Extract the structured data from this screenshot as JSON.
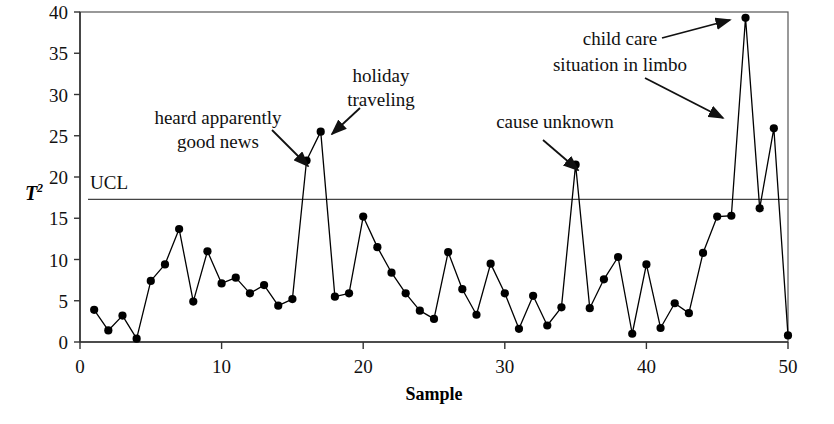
{
  "chart_data": {
    "type": "line",
    "title": "",
    "xlabel": "Sample",
    "ylabel": "T²",
    "ylabel_base": "T",
    "ylabel_exponent": "2",
    "xlim": [
      0,
      50
    ],
    "ylim": [
      0,
      40
    ],
    "grid": false,
    "legend": "none",
    "x_ticks": [
      0,
      10,
      20,
      30,
      40,
      50
    ],
    "y_ticks": [
      0,
      5,
      10,
      15,
      20,
      25,
      30,
      35,
      40
    ],
    "marker": "filled-circle",
    "line_color": "#000000",
    "marker_color": "#000000",
    "control_limits": [
      {
        "name": "UCL",
        "label": "UCL",
        "value": 17.3
      }
    ],
    "x": [
      1,
      2,
      3,
      4,
      5,
      6,
      7,
      8,
      9,
      10,
      11,
      12,
      13,
      14,
      15,
      16,
      17,
      18,
      19,
      20,
      21,
      22,
      23,
      24,
      25,
      26,
      27,
      28,
      29,
      30,
      31,
      32,
      33,
      34,
      35,
      36,
      37,
      38,
      39,
      40,
      41,
      42,
      43,
      44,
      45,
      46,
      47,
      48,
      49,
      50
    ],
    "values": [
      3.9,
      1.4,
      3.2,
      0.4,
      7.4,
      9.4,
      13.7,
      4.9,
      11.0,
      7.1,
      7.8,
      5.9,
      6.9,
      4.4,
      5.2,
      22.0,
      25.5,
      5.5,
      5.9,
      15.2,
      11.5,
      8.4,
      5.9,
      3.8,
      2.8,
      10.9,
      6.4,
      3.3,
      9.5,
      5.9,
      1.6,
      5.6,
      2.0,
      4.2,
      21.5,
      4.1,
      7.6,
      10.3,
      1.0,
      9.4,
      1.7,
      4.7,
      3.5,
      10.8,
      15.2,
      15.3,
      39.3,
      16.2,
      25.9,
      0.8
    ],
    "annotations": [
      {
        "id": "heard-good-news",
        "lines": [
          "heard apparently",
          "good news"
        ],
        "text_x": 218,
        "text_y": 124,
        "line_height": 24,
        "align": "middle",
        "arrow": {
          "x1": 272,
          "y1": 130,
          "x2": 308,
          "y2": 166
        },
        "points_to_sample": 16
      },
      {
        "id": "holiday-traveling",
        "lines": [
          "holiday",
          "traveling"
        ],
        "text_x": 381,
        "text_y": 82,
        "line_height": 24,
        "align": "middle",
        "arrow": {
          "x1": 360,
          "y1": 108,
          "x2": 332,
          "y2": 134
        },
        "points_to_sample": 17
      },
      {
        "id": "cause-unknown",
        "lines": [
          "cause unknown"
        ],
        "text_x": 555,
        "text_y": 128,
        "line_height": 24,
        "align": "middle",
        "arrow": {
          "x1": 543,
          "y1": 140,
          "x2": 578,
          "y2": 170
        },
        "points_to_sample": 35
      },
      {
        "id": "child-care-limbo",
        "lines": [
          "child care",
          "situation in limbo"
        ],
        "text_x": 620,
        "text_y": 45,
        "line_height": 26,
        "align": "middle",
        "arrow": {
          "x1": 662,
          "y1": 38,
          "x2": 730,
          "y2": 20
        },
        "points_to_sample": 47
      },
      {
        "id": "child-care-limbo-second-arrow",
        "lines": [],
        "text_x": 0,
        "text_y": 0,
        "line_height": 0,
        "align": "middle",
        "arrow": {
          "x1": 645,
          "y1": 78,
          "x2": 723,
          "y2": 118
        },
        "points_to_sample": 47
      }
    ]
  },
  "axes": {
    "plot_left": 80,
    "plot_right": 788,
    "plot_top": 12,
    "plot_bottom": 342,
    "border_color": "#555555",
    "axis_color": "#333333"
  }
}
